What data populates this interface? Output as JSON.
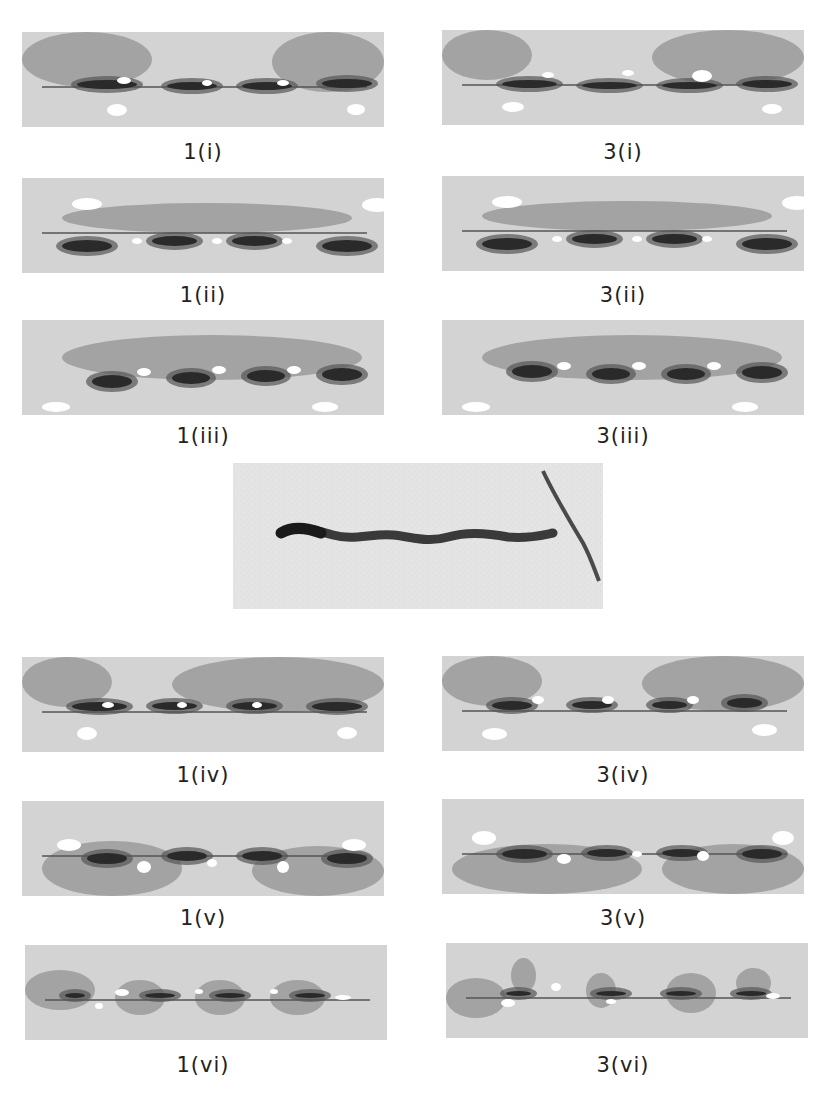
{
  "figure": {
    "colors": {
      "background": "#d3d3d3",
      "mid_gray": "#9a9a9a",
      "dark": "#2a2a2a",
      "light": "#ffffff",
      "micro_bg": "#e4e4e4"
    },
    "panels": [
      {
        "id": "1-i",
        "label": "1(i)",
        "column": "1",
        "row": "i"
      },
      {
        "id": "3-i",
        "label": "3(i)",
        "column": "3",
        "row": "i"
      },
      {
        "id": "1-ii",
        "label": "1(ii)",
        "column": "1",
        "row": "ii"
      },
      {
        "id": "3-ii",
        "label": "3(ii)",
        "column": "3",
        "row": "ii"
      },
      {
        "id": "1-iii",
        "label": "1(iii)",
        "column": "1",
        "row": "iii"
      },
      {
        "id": "3-iii",
        "label": "3(iii)",
        "column": "3",
        "row": "iii"
      },
      {
        "id": "1-iv",
        "label": "1(iv)",
        "column": "1",
        "row": "iv"
      },
      {
        "id": "3-iv",
        "label": "3(iv)",
        "column": "3",
        "row": "iv"
      },
      {
        "id": "1-v",
        "label": "1(v)",
        "column": "1",
        "row": "v"
      },
      {
        "id": "3-v",
        "label": "3(v)",
        "column": "3",
        "row": "v"
      },
      {
        "id": "1-vi",
        "label": "1(vi)",
        "column": "1",
        "row": "vi"
      },
      {
        "id": "3-vi",
        "label": "3(vi)",
        "column": "3",
        "row": "vi"
      }
    ],
    "micrograph": {
      "description": "experimental micrograph"
    }
  }
}
